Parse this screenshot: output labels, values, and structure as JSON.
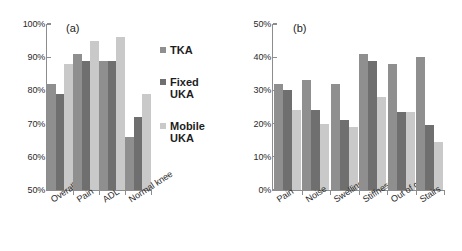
{
  "figure": {
    "background": "#ffffff",
    "series_colors": [
      "#8f8f8f",
      "#6f6f6f",
      "#c9c9c9"
    ]
  },
  "legend": {
    "position": "center-right of panel a",
    "entries": [
      {
        "label": "TKA",
        "color": "#8f8f8f"
      },
      {
        "label": "Fixed\nUKA",
        "color": "#6f6f6f"
      },
      {
        "label": "Mobile\nUKA",
        "color": "#c9c9c9"
      }
    ]
  },
  "panels": [
    {
      "tag": "(a)"
    },
    {
      "tag": "(b)"
    }
  ],
  "chart_data": [
    {
      "type": "bar",
      "title": "(a)",
      "xlabel": "",
      "ylabel": "",
      "ylim": [
        50,
        100
      ],
      "yticks": [
        50,
        60,
        70,
        80,
        90,
        100
      ],
      "ytick_labels": [
        "50%",
        "60%",
        "70%",
        "80%",
        "90%",
        "100%"
      ],
      "grid": false,
      "legend": [
        "TKA",
        "Fixed UKA",
        "Mobile UKA"
      ],
      "legend_position": "right",
      "categories": [
        "Overall",
        "Pain",
        "ADL",
        "Normal knee"
      ],
      "series": [
        {
          "name": "TKA",
          "color": "#8f8f8f",
          "values": [
            82,
            91,
            89,
            66
          ]
        },
        {
          "name": "Fixed UKA",
          "color": "#6f6f6f",
          "values": [
            79,
            89,
            89,
            72
          ]
        },
        {
          "name": "Mobile UKA",
          "color": "#c9c9c9",
          "values": [
            88,
            95,
            96,
            79
          ]
        }
      ]
    },
    {
      "type": "bar",
      "title": "(b)",
      "xlabel": "",
      "ylabel": "",
      "ylim": [
        0,
        50
      ],
      "yticks": [
        0,
        10,
        20,
        30,
        40,
        50
      ],
      "ytick_labels": [
        "0%",
        "10%",
        "20%",
        "30%",
        "40%",
        "50%"
      ],
      "grid": false,
      "legend": [
        "TKA",
        "Fixed UKA",
        "Mobile UKA"
      ],
      "legend_position": "none",
      "categories": [
        "Pain",
        "Noise",
        "Swelling",
        "Stiffness",
        "Out of car",
        "Stairs"
      ],
      "series": [
        {
          "name": "TKA",
          "color": "#8f8f8f",
          "values": [
            32,
            33,
            32,
            41,
            38,
            40
          ]
        },
        {
          "name": "Fixed UKA",
          "color": "#6f6f6f",
          "values": [
            30,
            24,
            21,
            39,
            23.5,
            19.5
          ]
        },
        {
          "name": "Mobile UKA",
          "color": "#c9c9c9",
          "values": [
            24,
            20,
            19,
            28,
            23.5,
            14.5
          ]
        }
      ]
    }
  ]
}
